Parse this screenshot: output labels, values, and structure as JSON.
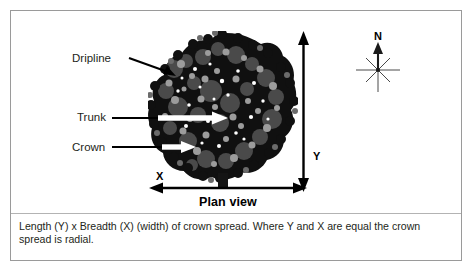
{
  "figure": {
    "title_below_diagram": "Plan view",
    "caption": "Length (Y) x Breadth (X) (width) of crown spread. Where Y and X are equal the crown spread is radial."
  },
  "labels": {
    "dripline": "Dripline",
    "trunk": "Trunk",
    "crown": "Crown"
  },
  "axes": {
    "x_label": "X",
    "y_label": "Y"
  },
  "compass": {
    "north_label": "N",
    "icon": "compass-rose-icon"
  },
  "icons": {
    "dripline_arrow": "arrow-right-down-icon",
    "trunk_arrow": "arrow-right-icon",
    "crown_arrow": "arrow-right-icon",
    "x_axis_arrow": "double-headed-horizontal-arrow-icon",
    "y_axis_arrow": "double-headed-vertical-arrow-icon",
    "tree": "tree-canopy-plan-view-icon"
  },
  "colors": {
    "frame_border": "#9a9a9a",
    "divider": "#b3b3b3",
    "text": "#231f20",
    "arrow_dark": "#000000",
    "arrow_light": "#ffffff",
    "canopy_dark": "#101010",
    "canopy_mid": "#4d4d4d",
    "canopy_light": "#9c9c9c",
    "background": "#ffffff"
  }
}
